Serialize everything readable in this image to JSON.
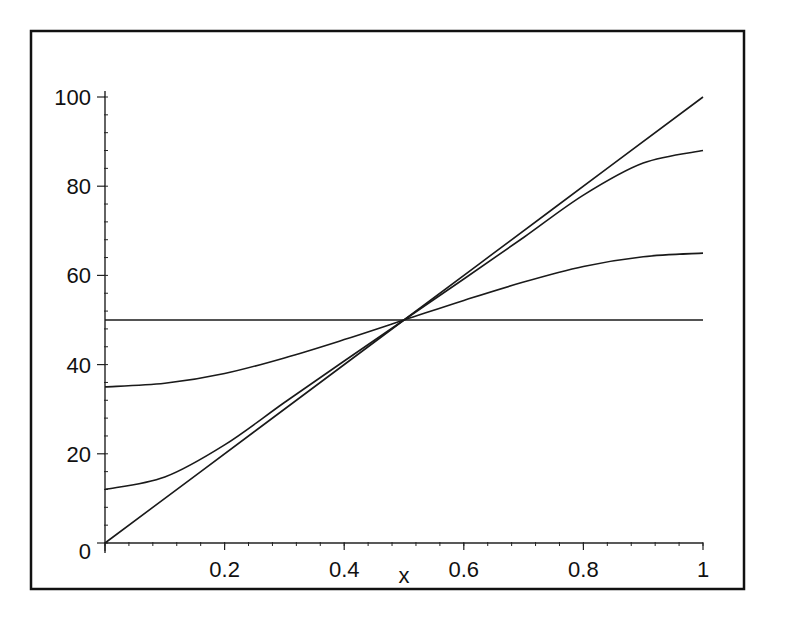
{
  "chart_data": {
    "type": "line",
    "title": "",
    "xlabel": "x",
    "ylabel": "",
    "xlim": [
      0,
      1
    ],
    "ylim": [
      0,
      100
    ],
    "x_ticks": [
      0.2,
      0.4,
      0.6,
      0.8,
      1
    ],
    "x_tick_labels": [
      "0.2",
      "0.4",
      "0.6",
      "0.8",
      "1"
    ],
    "y_ticks": [
      0,
      20,
      40,
      60,
      80,
      100
    ],
    "y_tick_labels": [
      "0",
      "20",
      "40",
      "60",
      "80",
      "100"
    ],
    "grid": false,
    "legend": null,
    "series": [
      {
        "name": "curve-1 (linear)",
        "x": [
          0,
          0.25,
          0.5,
          0.75,
          1
        ],
        "values": [
          0,
          25,
          50,
          75,
          100
        ]
      },
      {
        "name": "curve-2",
        "x": [
          0,
          0.1,
          0.2,
          0.3,
          0.4,
          0.5,
          0.6,
          0.7,
          0.8,
          0.9,
          1
        ],
        "values": [
          12,
          14.8,
          22,
          31.5,
          40.8,
          50,
          59.2,
          68.5,
          78,
          85.2,
          88
        ]
      },
      {
        "name": "curve-3",
        "x": [
          0,
          0.1,
          0.2,
          0.3,
          0.4,
          0.5,
          0.6,
          0.7,
          0.8,
          0.9,
          1
        ],
        "values": [
          35,
          35.8,
          38,
          41.5,
          45.6,
          50,
          54.4,
          58.5,
          62,
          64.2,
          65
        ]
      },
      {
        "name": "curve-4 (constant)",
        "x": [
          0,
          1
        ],
        "values": [
          50,
          50
        ]
      }
    ],
    "annotations": [
      "all curves intersect at (0.5, 50)"
    ]
  }
}
